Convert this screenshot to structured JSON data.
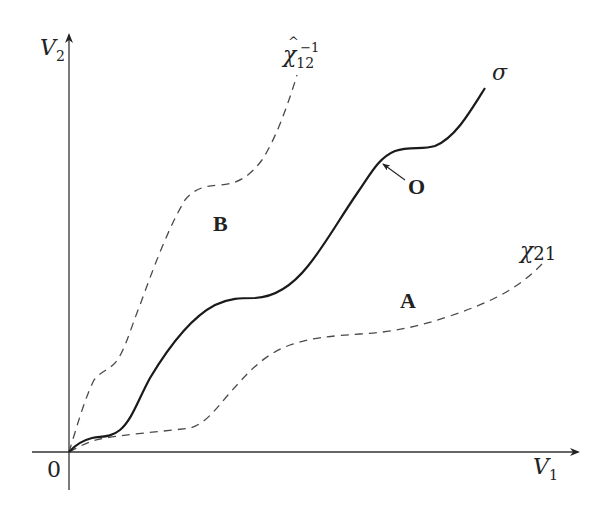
{
  "diagram": {
    "axes": {
      "x_label": {
        "main": "V",
        "sub": "1"
      },
      "y_label": {
        "main": "V",
        "sub": "2"
      },
      "origin_label": "0"
    },
    "curves": [
      {
        "id": "sigma",
        "label": "σ",
        "style": "solid",
        "color": "#1a1a1a"
      },
      {
        "id": "chi12-hat-inverse",
        "label_main": "χ",
        "label_hat": "^",
        "label_sub": "12",
        "label_sup": "−1",
        "style": "dashed",
        "color": "#444444"
      },
      {
        "id": "chi21",
        "label_main": "χ",
        "label_sub": "21",
        "style": "dashed",
        "color": "#444444"
      }
    ],
    "regions": {
      "A": "A",
      "B": "B"
    },
    "point": {
      "label": "O"
    },
    "colors": {
      "axis": "#333333",
      "solid_curve": "#1a1a1a",
      "dashed_curve": "#4a4a4a",
      "text": "#222222"
    }
  }
}
